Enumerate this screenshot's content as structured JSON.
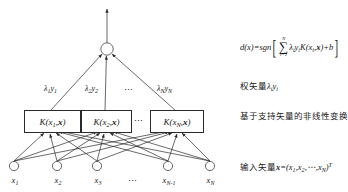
{
  "diagram": {
    "title_alt": "SVM network structure diagram",
    "output_node": {
      "name": "output-node",
      "shape": "circle"
    },
    "weight_labels": [
      {
        "lambda": "λ",
        "sub1": "1",
        "y": "y",
        "sub2": "1"
      },
      {
        "lambda": "λ",
        "sub1": "2",
        "y": "y",
        "sub2": "2"
      },
      {
        "lambda": "λ",
        "sub1": "N",
        "y": "y",
        "sub2": "N"
      }
    ],
    "weight_label_texts": [
      "λ₁y₁",
      "λ₂y₂",
      "λₙyₙ"
    ],
    "weight_ellipsis": "⋯",
    "kernel_nodes": [
      {
        "fn": "K",
        "arg_sub": "1",
        "label": "K(x1,x)"
      },
      {
        "fn": "K",
        "arg_sub": "2",
        "label": "K(x2,x)"
      },
      {
        "fn": "K",
        "arg_sub": "N",
        "label": "K(xN,x)"
      }
    ],
    "kernel_ellipsis": "⋯",
    "input_nodes": [
      {
        "name": "x",
        "sub": "1"
      },
      {
        "name": "x",
        "sub": "2"
      },
      {
        "name": "x",
        "sub": "3"
      },
      {
        "name": "x",
        "sub": "N-1"
      },
      {
        "name": "x",
        "sub": "N"
      }
    ],
    "input_ellipsis": "⋯"
  },
  "annotations": {
    "decision_function": {
      "lhs": "d(x)=sgn",
      "bracket_open": "[",
      "sum_upper": "N",
      "sum_symbol": "∑",
      "sum_lower": "i=1",
      "body_lambda": "λ",
      "body_lambda_sub": "i",
      "body_y": "y",
      "body_y_sub": "i",
      "body_kernel": "K(x",
      "body_kernel_sub": "i",
      "body_kernel_rest": ",x)+b",
      "bracket_close": "]",
      "plain": "d(x)=sgn[ Σ i=1..N λi yi K(xi,x)+b ]"
    },
    "weight_vector_line": "权矢量λᵢyᵢ",
    "weight_vector_cjk": "权矢量",
    "weight_vector_math": "λ",
    "weight_vector_math_sub": "i",
    "weight_vector_math2": "y",
    "weight_vector_math2_sub": "i",
    "nonlinear_transform_line": "基于支持矢量的非线性变换",
    "input_vector_cjk": "输入矢量",
    "input_vector_math": "x=(x",
    "input_vector_sub1": "1",
    "input_vector_mid": ",x",
    "input_vector_sub2": "2",
    "input_vector_dots": ",⋯,x",
    "input_vector_sub3": "N",
    "input_vector_close": ")",
    "input_vector_sup": "T",
    "input_vector_plain": "输入矢量x=(x₁,x₂,⋯,xₙ)ᵀ"
  },
  "colors": {
    "stroke": "#2a2a2a",
    "text": "#1a1a1a",
    "background": "#ffffff"
  }
}
